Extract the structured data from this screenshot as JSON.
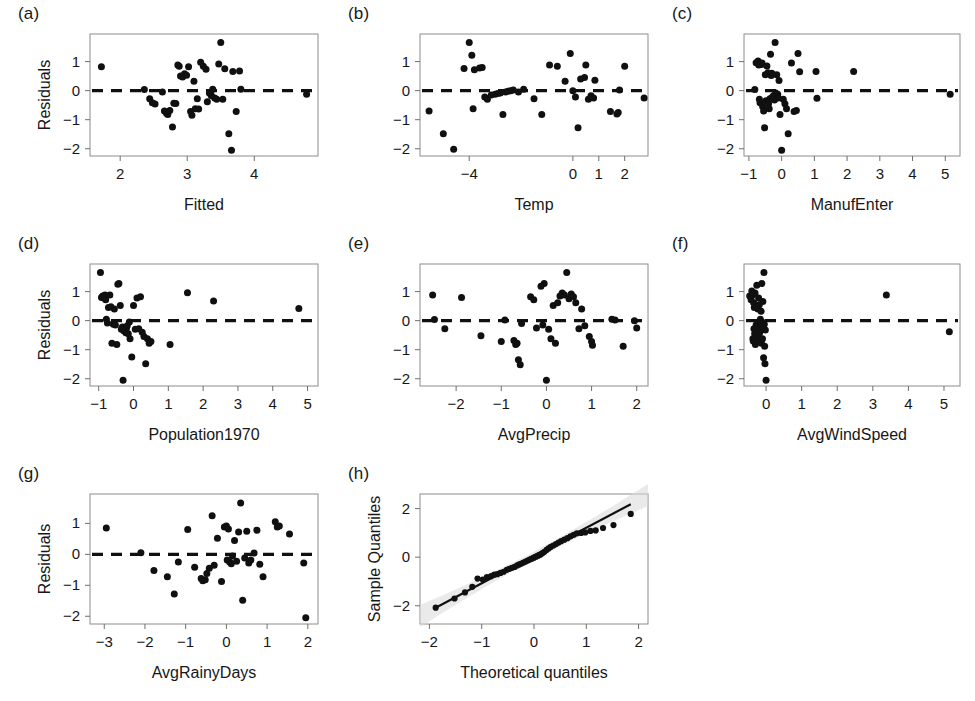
{
  "figure": {
    "kind": "regression-diagnostic-panel-grid",
    "panel_count": 8,
    "marker_color": "#101010",
    "reference_line_color": "#101010",
    "frame_color": "#8c8c8c",
    "band_color": "#d8d8d8"
  },
  "panels": [
    {
      "label": "(a)",
      "ylabel": "Residuals",
      "xlabel": "Fitted",
      "xticks": [
        2,
        3,
        4
      ],
      "yticks": [
        1,
        0,
        -1,
        -2
      ],
      "xlim": [
        1.55,
        4.95
      ],
      "ylim": [
        -2.25,
        1.95
      ],
      "refline_y": 0
    },
    {
      "label": "(b)",
      "ylabel": "",
      "xlabel": "Temp",
      "xticks": [
        -4,
        0,
        1,
        2
      ],
      "yticks": [
        1,
        0,
        -1,
        -2
      ],
      "xlim": [
        -5.9,
        2.9
      ],
      "ylim": [
        -2.25,
        1.95
      ],
      "refline_y": 0
    },
    {
      "label": "(c)",
      "ylabel": "",
      "xlabel": "ManufEnter",
      "xticks": [
        -1,
        0,
        1,
        2,
        3,
        4,
        5
      ],
      "yticks": [
        1,
        0,
        -1,
        -2
      ],
      "xlim": [
        -1.15,
        5.45
      ],
      "ylim": [
        -2.25,
        1.95
      ],
      "refline_y": 0
    },
    {
      "label": "(d)",
      "ylabel": "Residuals",
      "xlabel": "Population1970",
      "xticks": [
        -1,
        0,
        1,
        2,
        3,
        4,
        5
      ],
      "yticks": [
        1,
        0,
        -1,
        -2
      ],
      "xlim": [
        -1.25,
        5.3
      ],
      "ylim": [
        -2.25,
        1.95
      ],
      "refline_y": 0
    },
    {
      "label": "(e)",
      "ylabel": "",
      "xlabel": "AvgPrecip",
      "xticks": [
        -2,
        -1,
        0,
        1,
        2
      ],
      "yticks": [
        1,
        0,
        -1,
        -2
      ],
      "xlim": [
        -2.8,
        2.25
      ],
      "ylim": [
        -2.25,
        1.95
      ],
      "refline_y": 0
    },
    {
      "label": "(f)",
      "ylabel": "",
      "xlabel": "AvgWindSpeed",
      "xticks": [
        0,
        1,
        2,
        3,
        4,
        5
      ],
      "yticks": [
        1,
        0,
        -1,
        -2
      ],
      "xlim": [
        -0.62,
        5.45
      ],
      "ylim": [
        -2.25,
        1.95
      ],
      "refline_y": 0
    },
    {
      "label": "(g)",
      "ylabel": "Residuals",
      "xlabel": "AvgRainyDays",
      "xticks": [
        -3,
        -2,
        -1,
        0,
        1,
        2
      ],
      "yticks": [
        1,
        0,
        -1,
        -2
      ],
      "xlim": [
        -3.35,
        2.25
      ],
      "ylim": [
        -2.25,
        1.95
      ],
      "refline_y": 0
    },
    {
      "label": "(h)",
      "ylabel": "Sample Quantiles",
      "xlabel": "Theoretical quantiles",
      "xticks": [
        -2,
        -1,
        0,
        1,
        2
      ],
      "yticks": [
        2,
        0,
        -2
      ],
      "xlim": [
        -2.18,
        2.18
      ],
      "ylim": [
        -2.75,
        2.6
      ],
      "refline_y": null
    }
  ],
  "chart_data": [
    {
      "type": "scatter",
      "panel": "(a)",
      "title": "(a)",
      "xlabel": "Fitted",
      "ylabel": "Residuals",
      "xlim": [
        1.55,
        4.95
      ],
      "ylim": [
        -2.25,
        1.95
      ],
      "xticks": [
        2,
        3,
        4
      ],
      "yticks": [
        1,
        0,
        -1,
        -2
      ],
      "grid": false,
      "reference_line": {
        "type": "horizontal",
        "y": 0,
        "style": "dashed"
      },
      "x": [
        1.72,
        2.36,
        2.44,
        2.48,
        2.52,
        2.63,
        2.66,
        2.69,
        2.71,
        2.74,
        2.78,
        2.8,
        2.83,
        2.86,
        2.88,
        2.9,
        2.93,
        2.96,
        2.99,
        3.02,
        3.05,
        3.07,
        3.1,
        3.12,
        3.15,
        3.17,
        3.2,
        3.24,
        3.28,
        3.3,
        3.33,
        3.35,
        3.36,
        3.38,
        3.41,
        3.44,
        3.47,
        3.5,
        3.53,
        3.56,
        3.62,
        3.66,
        3.68,
        3.73,
        3.78,
        3.8,
        4.78
      ],
      "y": [
        0.82,
        0.04,
        -0.28,
        -0.42,
        -0.46,
        -0.05,
        -0.7,
        -0.78,
        -0.82,
        -0.68,
        -1.25,
        -0.43,
        -0.44,
        0.88,
        0.84,
        0.5,
        0.47,
        0.58,
        0.53,
        0.82,
        -0.72,
        -0.85,
        0.32,
        -0.62,
        -0.28,
        -0.63,
        0.98,
        0.84,
        0.74,
        -0.38,
        -0.08,
        -0.12,
        -0.18,
        0.05,
        -0.25,
        -0.3,
        0.92,
        1.66,
        -0.3,
        0.75,
        -1.48,
        -2.05,
        0.66,
        -0.72,
        0.68,
        0.05,
        -0.12
      ]
    },
    {
      "type": "scatter",
      "panel": "(b)",
      "title": "(b)",
      "xlabel": "Temp",
      "ylabel": "",
      "xlim": [
        -5.9,
        2.9
      ],
      "ylim": [
        -2.25,
        1.95
      ],
      "xticks": [
        -4,
        0,
        1,
        2
      ],
      "yticks": [
        1,
        0,
        -1,
        -2
      ],
      "grid": false,
      "reference_line": {
        "type": "horizontal",
        "y": 0,
        "style": "dashed"
      },
      "x": [
        -5.55,
        -5.0,
        -4.6,
        -4.2,
        -4.0,
        -3.9,
        -3.85,
        -3.8,
        -3.6,
        -3.5,
        -3.4,
        -3.3,
        -3.15,
        -3.0,
        -2.9,
        -2.8,
        -2.7,
        -2.6,
        -2.5,
        -2.4,
        -2.3,
        -2.1,
        -1.9,
        -1.5,
        -1.2,
        -0.9,
        -0.6,
        -0.3,
        -0.1,
        0.0,
        0.1,
        0.2,
        0.3,
        0.45,
        0.5,
        0.6,
        0.7,
        0.8,
        0.85,
        1.45,
        1.7,
        1.75,
        1.8,
        2.0,
        2.75
      ],
      "y": [
        -0.7,
        -1.48,
        -2.02,
        0.76,
        1.66,
        1.22,
        -0.62,
        0.72,
        0.78,
        0.8,
        -0.22,
        -0.3,
        -0.15,
        -0.12,
        -0.1,
        -0.08,
        -0.82,
        -0.05,
        -0.02,
        0.0,
        0.02,
        -0.05,
        0.05,
        -0.28,
        -0.82,
        0.88,
        0.84,
        0.32,
        1.28,
        0.0,
        -0.22,
        -1.28,
        0.4,
        0.45,
        0.88,
        -0.3,
        -0.18,
        -0.25,
        0.36,
        -0.72,
        -0.8,
        -0.75,
        0.02,
        0.84,
        -0.25
      ]
    },
    {
      "type": "scatter",
      "panel": "(c)",
      "title": "(c)",
      "xlabel": "ManufEnter",
      "ylabel": "",
      "xlim": [
        -1.15,
        5.45
      ],
      "ylim": [
        -2.25,
        1.95
      ],
      "xticks": [
        -1,
        0,
        1,
        2,
        3,
        4,
        5
      ],
      "yticks": [
        1,
        0,
        -1,
        -2
      ],
      "grid": false,
      "reference_line": {
        "type": "horizontal",
        "y": 0,
        "style": "dashed"
      },
      "x": [
        -0.82,
        -0.78,
        -0.72,
        -0.7,
        -0.68,
        -0.66,
        -0.62,
        -0.6,
        -0.58,
        -0.55,
        -0.52,
        -0.5,
        -0.48,
        -0.45,
        -0.42,
        -0.4,
        -0.38,
        -0.36,
        -0.34,
        -0.32,
        -0.3,
        -0.28,
        -0.25,
        -0.22,
        -0.2,
        -0.18,
        -0.15,
        -0.12,
        -0.1,
        -0.08,
        -0.05,
        0.0,
        0.05,
        0.1,
        0.15,
        0.2,
        0.3,
        0.38,
        0.45,
        0.5,
        0.55,
        1.05,
        1.08,
        2.2,
        5.15
      ],
      "y": [
        0.04,
        0.96,
        1.02,
        0.88,
        -0.3,
        -0.42,
        0.9,
        0.95,
        -0.55,
        -0.7,
        -1.28,
        0.55,
        -0.35,
        0.85,
        0.62,
        -0.45,
        -0.62,
        -0.28,
        1.25,
        0.52,
        0.6,
        -0.22,
        -0.18,
        -0.32,
        1.66,
        -0.08,
        0.55,
        -0.12,
        -0.25,
        0.35,
        -0.82,
        -2.05,
        -0.3,
        -0.45,
        -0.62,
        -1.48,
        0.95,
        -0.72,
        -0.68,
        1.28,
        0.65,
        0.66,
        -0.26,
        0.66,
        -0.12
      ]
    },
    {
      "type": "scatter",
      "panel": "(d)",
      "title": "(d)",
      "xlabel": "Population1970",
      "ylabel": "Residuals",
      "xlim": [
        -1.25,
        5.3
      ],
      "ylim": [
        -2.25,
        1.95
      ],
      "xticks": [
        -1,
        0,
        1,
        2,
        3,
        4,
        5
      ],
      "yticks": [
        1,
        0,
        -1,
        -2
      ],
      "grid": false,
      "reference_line": {
        "type": "horizontal",
        "y": 0,
        "style": "dashed"
      },
      "x": [
        -0.95,
        -0.92,
        -0.9,
        -0.88,
        -0.85,
        -0.82,
        -0.8,
        -0.78,
        -0.75,
        -0.72,
        -0.68,
        -0.65,
        -0.62,
        -0.58,
        -0.55,
        -0.52,
        -0.48,
        -0.45,
        -0.42,
        -0.38,
        -0.35,
        -0.32,
        -0.3,
        -0.28,
        -0.25,
        -0.22,
        -0.2,
        -0.18,
        -0.15,
        -0.12,
        -0.1,
        -0.05,
        0.0,
        0.05,
        0.1,
        0.15,
        0.2,
        0.25,
        0.3,
        0.35,
        0.4,
        0.45,
        0.5,
        1.05,
        1.55,
        2.3,
        4.75
      ],
      "y": [
        1.66,
        0.8,
        0.82,
        0.85,
        0.78,
        0.88,
        0.72,
        0.05,
        -0.08,
        0.45,
        0.88,
        0.48,
        -0.78,
        -0.12,
        0.4,
        -0.15,
        -0.82,
        1.25,
        1.28,
        0.52,
        -0.3,
        -0.22,
        -2.05,
        -0.35,
        -0.28,
        -0.42,
        -0.25,
        -0.18,
        -0.45,
        -0.05,
        -0.62,
        -1.25,
        0.52,
        -0.3,
        0.78,
        -0.28,
        0.82,
        -0.4,
        -0.55,
        -1.48,
        -0.62,
        -0.78,
        -0.72,
        -0.82,
        0.96,
        0.68,
        0.42
      ]
    },
    {
      "type": "scatter",
      "panel": "(e)",
      "title": "(e)",
      "xlabel": "AvgPrecip",
      "ylabel": "",
      "xlim": [
        -2.8,
        2.25
      ],
      "ylim": [
        -2.25,
        1.95
      ],
      "xticks": [
        -2,
        -1,
        0,
        1,
        2
      ],
      "yticks": [
        1,
        0,
        -1,
        -2
      ],
      "grid": false,
      "reference_line": {
        "type": "horizontal",
        "y": 0,
        "style": "dashed"
      },
      "x": [
        -2.52,
        -2.48,
        -2.25,
        -1.88,
        -1.45,
        -1.0,
        -0.92,
        -0.72,
        -0.68,
        -0.65,
        -0.62,
        -0.58,
        -0.55,
        -0.35,
        -0.28,
        -0.22,
        -0.12,
        -0.08,
        -0.05,
        0.0,
        0.05,
        0.1,
        0.15,
        0.2,
        0.25,
        0.3,
        0.35,
        0.4,
        0.45,
        0.5,
        0.55,
        0.6,
        0.65,
        0.72,
        0.78,
        0.85,
        0.95,
        1.0,
        1.02,
        1.45,
        1.52,
        1.7,
        1.95,
        2.0
      ],
      "y": [
        0.88,
        0.04,
        -0.28,
        0.8,
        -0.52,
        -0.72,
        0.02,
        -0.68,
        -0.82,
        -0.78,
        -1.35,
        -1.52,
        -0.1,
        0.82,
        0.72,
        -0.25,
        1.18,
        -0.15,
        1.28,
        -2.05,
        -0.3,
        -0.62,
        0.52,
        -0.78,
        0.62,
        0.85,
        0.95,
        0.88,
        1.66,
        0.75,
        0.92,
        0.82,
        0.62,
        -0.28,
        0.4,
        -0.18,
        -0.55,
        -0.72,
        -0.85,
        0.05,
        0.02,
        -0.88,
        0.0,
        -0.25
      ]
    },
    {
      "type": "scatter",
      "panel": "(f)",
      "title": "(f)",
      "xlabel": "AvgWindSpeed",
      "ylabel": "",
      "xlim": [
        -0.62,
        5.45
      ],
      "ylim": [
        -2.25,
        1.95
      ],
      "xticks": [
        0,
        1,
        2,
        3,
        4,
        5
      ],
      "yticks": [
        1,
        0,
        -1,
        -2
      ],
      "grid": false,
      "reference_line": {
        "type": "horizontal",
        "y": 0,
        "style": "dashed"
      },
      "x": [
        -0.46,
        -0.42,
        -0.4,
        -0.38,
        -0.37,
        -0.36,
        -0.35,
        -0.34,
        -0.33,
        -0.32,
        -0.31,
        -0.3,
        -0.29,
        -0.28,
        -0.27,
        -0.26,
        -0.25,
        -0.24,
        -0.23,
        -0.22,
        -0.21,
        -0.2,
        -0.19,
        -0.18,
        -0.17,
        -0.16,
        -0.15,
        -0.14,
        -0.13,
        -0.12,
        -0.11,
        -0.1,
        -0.09,
        -0.08,
        -0.07,
        -0.06,
        -0.05,
        -0.04,
        -0.03,
        -0.02,
        0.0,
        3.38,
        5.15
      ],
      "y": [
        0.85,
        0.72,
        1.02,
        0.88,
        -0.62,
        -0.7,
        0.62,
        -0.28,
        0.45,
        -0.45,
        0.95,
        -0.82,
        0.52,
        -0.15,
        -0.35,
        1.22,
        -0.25,
        -0.55,
        0.4,
        -0.72,
        0.78,
        -0.08,
        0.55,
        -0.42,
        -0.3,
        0.05,
        -0.18,
        0.32,
        -0.78,
        1.28,
        -0.05,
        -0.62,
        0.66,
        -0.22,
        -1.28,
        1.66,
        -0.12,
        -0.88,
        -1.48,
        -0.32,
        -2.05,
        0.88,
        -0.38
      ]
    },
    {
      "type": "scatter",
      "panel": "(g)",
      "title": "(g)",
      "xlabel": "AvgRainyDays",
      "ylabel": "Residuals",
      "xlim": [
        -3.35,
        2.25
      ],
      "ylim": [
        -2.25,
        1.95
      ],
      "xticks": [
        -3,
        -2,
        -1,
        0,
        1,
        2
      ],
      "yticks": [
        1,
        0,
        -1,
        -2
      ],
      "grid": false,
      "reference_line": {
        "type": "horizontal",
        "y": 0,
        "style": "dashed"
      },
      "x": [
        -2.95,
        -2.1,
        -1.78,
        -1.45,
        -1.28,
        -1.18,
        -0.95,
        -0.78,
        -0.62,
        -0.58,
        -0.52,
        -0.48,
        -0.42,
        -0.35,
        -0.3,
        -0.22,
        -0.12,
        -0.05,
        0.0,
        0.02,
        0.05,
        0.08,
        0.12,
        0.15,
        0.2,
        0.25,
        0.3,
        0.35,
        0.4,
        0.45,
        0.5,
        0.55,
        0.6,
        0.68,
        0.75,
        0.82,
        0.9,
        1.2,
        1.25,
        1.3,
        1.55,
        1.9,
        1.95
      ],
      "y": [
        0.85,
        0.05,
        -0.52,
        -0.72,
        -1.28,
        -0.25,
        0.8,
        -0.42,
        -0.78,
        -0.85,
        -0.82,
        -0.62,
        -0.45,
        1.25,
        -0.35,
        0.52,
        -0.88,
        0.88,
        0.92,
        -0.18,
        0.82,
        -0.25,
        -0.3,
        -0.05,
        0.45,
        -0.22,
        0.72,
        1.66,
        -1.48,
        -0.12,
        0.75,
        -0.28,
        -0.18,
        0.04,
        0.78,
        -0.32,
        -0.72,
        1.05,
        0.88,
        0.92,
        0.66,
        -0.28,
        -2.05
      ]
    },
    {
      "type": "scatter",
      "panel": "(h)",
      "title": "(h)",
      "xlabel": "Theoretical quantiles",
      "ylabel": "Sample Quantiles",
      "xlim": [
        -2.18,
        2.18
      ],
      "ylim": [
        -2.75,
        2.6
      ],
      "xticks": [
        -2,
        -1,
        0,
        1,
        2
      ],
      "yticks": [
        2,
        0,
        -2
      ],
      "grid": false,
      "fit_line": {
        "x": [
          -1.88,
          1.85
        ],
        "y": [
          -2.08,
          2.18
        ]
      },
      "confidence_band": true,
      "x": [
        -1.88,
        -1.52,
        -1.32,
        -1.18,
        -1.08,
        -0.98,
        -0.9,
        -0.82,
        -0.76,
        -0.7,
        -0.64,
        -0.58,
        -0.52,
        -0.47,
        -0.42,
        -0.37,
        -0.32,
        -0.28,
        -0.24,
        -0.2,
        -0.16,
        -0.12,
        -0.08,
        -0.04,
        0.0,
        0.04,
        0.08,
        0.12,
        0.16,
        0.2,
        0.24,
        0.28,
        0.32,
        0.37,
        0.42,
        0.47,
        0.52,
        0.58,
        0.64,
        0.7,
        0.76,
        0.82,
        0.9,
        0.98,
        1.08,
        1.18,
        1.32,
        1.52,
        1.85
      ],
      "y": [
        -2.08,
        -1.7,
        -1.45,
        -1.22,
        -0.88,
        -0.92,
        -0.82,
        -0.78,
        -0.72,
        -0.7,
        -0.65,
        -0.6,
        -0.52,
        -0.48,
        -0.44,
        -0.4,
        -0.34,
        -0.3,
        -0.26,
        -0.22,
        -0.18,
        -0.14,
        -0.1,
        -0.06,
        -0.02,
        0.02,
        0.06,
        0.1,
        0.16,
        0.22,
        0.3,
        0.36,
        0.42,
        0.48,
        0.54,
        0.6,
        0.66,
        0.72,
        0.78,
        0.86,
        0.92,
        0.98,
        1.0,
        1.02,
        1.08,
        1.1,
        1.2,
        1.32,
        1.78
      ]
    }
  ]
}
